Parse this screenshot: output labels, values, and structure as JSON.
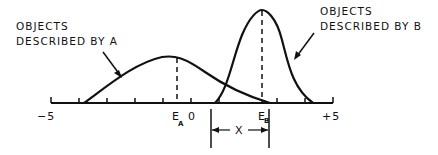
{
  "diagram": {
    "label_a": [
      "OBJECTS",
      "DESCRIBED BY A"
    ],
    "label_b": [
      "OBJECTS",
      "DESCRIBED BY B"
    ],
    "axis": {
      "min_label": "−5",
      "max_label": "+5",
      "zero_label": "0",
      "ea_main": "E",
      "ea_sub": "A",
      "eb_main": "E",
      "eb_sub": "B",
      "x_label": "X"
    },
    "colors": {
      "ink": "#111111",
      "background": "#ffffff"
    }
  }
}
